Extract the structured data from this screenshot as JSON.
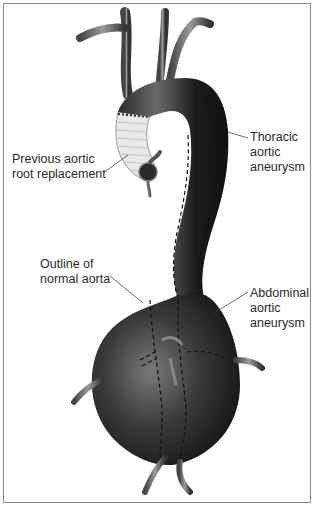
{
  "diagram": {
    "labels": {
      "thoracic": "Thoracic\naortic\naneurysm",
      "root": "Previous aortic\nroot replacement",
      "outline": "Outline of\nnormal aorta",
      "abdominal": "Abdominal\naortic\naneurysm"
    },
    "colors": {
      "vessel_dark": "#1e1e1e",
      "vessel_mid": "#555555",
      "graft": "#e6e6e6",
      "border": "#8a8a8a",
      "text": "#2a2a2a"
    }
  }
}
